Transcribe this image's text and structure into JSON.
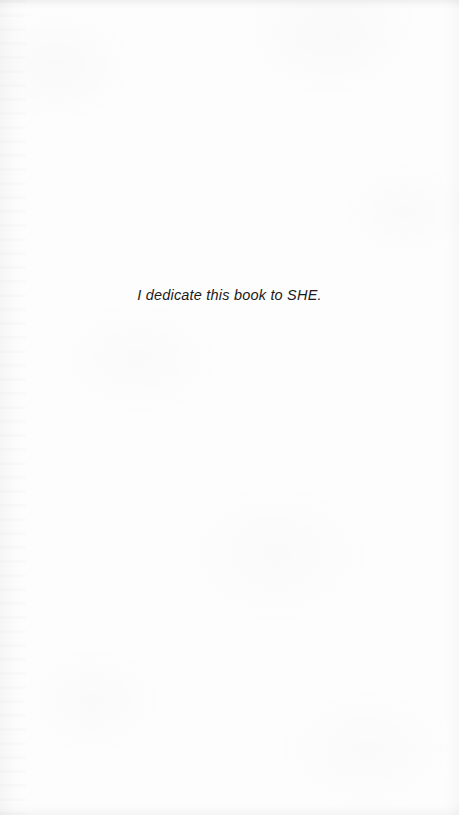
{
  "page": {
    "kind": "book-dedication-page",
    "background_color": "#fdfdfd",
    "text_color": "#1a1a1a"
  },
  "dedication": {
    "text": "I dedicate this book to SHE."
  }
}
